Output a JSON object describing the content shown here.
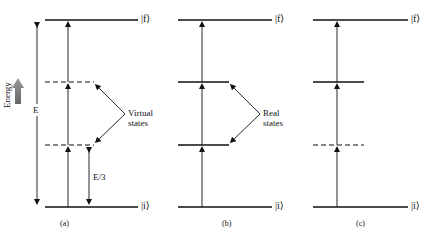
{
  "panels": [
    {
      "caption": "(a)",
      "final_state": "|f⟩",
      "initial_state": "|i⟩",
      "intermediate_label": "Virtual states",
      "intermediate_label_line1": "Virtual",
      "intermediate_label_line2": "states",
      "intermediate_levels": [
        "dashed",
        "dashed"
      ],
      "transition_label": "E/3"
    },
    {
      "caption": "(b)",
      "final_state": "|f⟩",
      "initial_state": "|i⟩",
      "intermediate_label": "Real states",
      "intermediate_label_line1": "Real",
      "intermediate_label_line2": "states",
      "intermediate_levels": [
        "solid",
        "solid"
      ]
    },
    {
      "caption": "(c)",
      "final_state": "|f⟩",
      "initial_state": "|i⟩",
      "intermediate_levels": [
        "solid",
        "dashed"
      ]
    }
  ],
  "axis": {
    "energy_label": "Energy",
    "total_energy_label": "E"
  },
  "colors": {
    "line": "#111111",
    "energy_arrow": "#777777"
  }
}
